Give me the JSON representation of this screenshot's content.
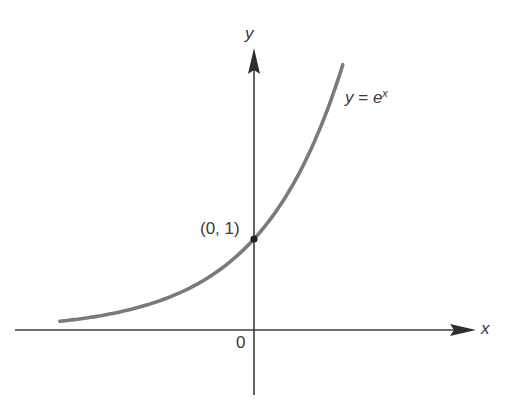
{
  "figure": {
    "y_axis_label": "y",
    "x_axis_label": "x",
    "origin_label": "0",
    "point_label": "(0, 1)",
    "curve_label": {
      "lhs": "y",
      "eq": " = ",
      "base": "e",
      "exp": "x"
    }
  },
  "colors": {
    "axis": "#3c3c3c",
    "curve": "#7a7a7a",
    "point": "#222222",
    "text": "#3a3a3a"
  },
  "geometry": {
    "origin_px": [
      254,
      330
    ],
    "px_per_unit_x": 83,
    "px_per_unit_y": 91,
    "x_axis_px": [
      15,
      476
    ],
    "y_axis_px": [
      395,
      48
    ]
  },
  "chart_data": {
    "type": "line",
    "xlabel": "x",
    "ylabel": "y",
    "function": "exp(x)",
    "x_range": [
      -2.34,
      1.07
    ],
    "annotations": [
      {
        "x": 0,
        "y": 1,
        "text": "(0, 1)"
      },
      {
        "x": 0,
        "y": 0,
        "text": "0"
      }
    ],
    "grid": false
  }
}
